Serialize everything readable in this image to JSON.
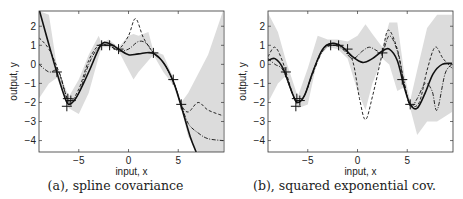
{
  "chart_data": [
    {
      "type": "line",
      "caption": "(a), spline covariance",
      "xlabel": "input, x",
      "ylabel": "output, y",
      "xlim": [
        -9,
        9.6
      ],
      "ylim": [
        -4.6,
        2.8
      ],
      "xticks": [
        "−5",
        "0",
        "5"
      ],
      "yticks": [
        "2",
        "1",
        "0",
        "−1",
        "−2",
        "−3",
        "−4"
      ],
      "training_points": {
        "x": [
          -7.2,
          -6.2,
          -6.1,
          -5.8,
          -2.7,
          -1.9,
          -1.0,
          2.5,
          4.5,
          5.3
        ],
        "y": [
          -0.4,
          -2.2,
          -1.8,
          -1.9,
          1.0,
          1.0,
          0.8,
          0.6,
          -0.8,
          -2.1
        ]
      },
      "series": [
        {
          "name": "mean",
          "style": "solid",
          "x": [
            -9,
            -7.5,
            -6.5,
            -6,
            -5.2,
            -4,
            -2.8,
            -2,
            -1,
            0,
            1,
            2.4,
            3.5,
            4.5,
            5.3,
            6.2,
            6.8
          ],
          "y": [
            2.9,
            0.1,
            -1.6,
            -2.1,
            -1.7,
            -0.4,
            1.0,
            1.1,
            0.8,
            0.5,
            0.55,
            0.6,
            0.1,
            -0.9,
            -2.2,
            -3.8,
            -4.6
          ]
        },
        {
          "name": "sample 1",
          "style": "dashed",
          "x": [
            -9,
            -8,
            -7,
            -6,
            -5,
            -4,
            -3,
            -2,
            -1,
            0,
            0.7,
            1.5,
            2.5,
            3.5,
            4.5,
            5.3,
            6,
            7,
            8,
            9.5
          ],
          "y": [
            1.4,
            0.8,
            -0.4,
            -1.9,
            -1.3,
            0.2,
            1.0,
            1.0,
            0.8,
            1.5,
            2.4,
            1.4,
            0.6,
            0.1,
            -0.9,
            -2.1,
            -2.5,
            -2.0,
            -2.4,
            -2.7
          ]
        },
        {
          "name": "sample 2",
          "style": "dash-dot",
          "x": [
            -9,
            -8,
            -7,
            -6,
            -5,
            -4,
            -3,
            -2,
            -1,
            0,
            1,
            1.8,
            2.5,
            3.5,
            4.5,
            5.3,
            6,
            7,
            8,
            9.5
          ],
          "y": [
            0.0,
            -0.4,
            -0.4,
            -2.0,
            -1.5,
            0.0,
            0.9,
            1.0,
            0.7,
            0.8,
            1.2,
            1.1,
            0.6,
            0.1,
            -0.9,
            -2.1,
            -3.1,
            -3.6,
            -3.9,
            -4.0
          ]
        }
      ],
      "confidence_band": {
        "x": [
          -9,
          -8,
          -7.2,
          -6,
          -5,
          -4,
          -3,
          -2.7,
          -2,
          -1,
          0,
          0.5,
          1,
          2,
          2.5,
          3.5,
          4.5,
          5.3,
          6,
          7,
          8,
          9.5
        ],
        "upper": [
          2.8,
          2.6,
          -0.1,
          -1.7,
          -0.8,
          0.5,
          1.5,
          1.1,
          1.3,
          0.9,
          1.5,
          1.6,
          1.5,
          1.7,
          0.7,
          0.5,
          -0.7,
          -2.0,
          -1.5,
          -0.5,
          0.5,
          2.8
        ],
        "lower": [
          -1.8,
          -1.0,
          -0.7,
          -2.3,
          -2.6,
          -1.5,
          0.4,
          0.9,
          0.9,
          0.7,
          -0.3,
          -0.8,
          -0.4,
          0.2,
          0.5,
          -0.4,
          -1.1,
          -2.3,
          -3.8,
          -4.6,
          -4.6,
          -4.6
        ]
      }
    },
    {
      "type": "line",
      "caption": "(b), squared exponential cov.",
      "xlabel": "input, x",
      "ylabel": "output, y",
      "xlim": [
        -9,
        9.6
      ],
      "ylim": [
        -4.6,
        2.8
      ],
      "xticks": [
        "−5",
        "0",
        "5"
      ],
      "yticks": [
        "2",
        "1",
        "0",
        "−1",
        "−2",
        "−3",
        "−4"
      ],
      "training_points": {
        "x": [
          -7.2,
          -6.2,
          -6.1,
          -5.8,
          -2.7,
          -1.9,
          -1.0,
          2.5,
          4.5,
          5.3
        ],
        "y": [
          -0.4,
          -2.2,
          -1.8,
          -1.9,
          1.0,
          1.0,
          0.8,
          0.6,
          -0.8,
          -2.1
        ]
      },
      "series": [
        {
          "name": "mean",
          "style": "solid",
          "x": [
            -9,
            -8.3,
            -7.5,
            -6.5,
            -6,
            -5.3,
            -4.5,
            -3.5,
            -2.5,
            -1.5,
            -0.5,
            0.5,
            1.5,
            2.5,
            3.2,
            4,
            4.7,
            5.3,
            6,
            6.8,
            7.6,
            8.5,
            9.5
          ],
          "y": [
            0.2,
            0.3,
            -0.2,
            -1.6,
            -2.0,
            -1.6,
            -0.4,
            0.8,
            1.1,
            0.9,
            0.4,
            0.1,
            0.3,
            0.7,
            0.8,
            0.2,
            -1.2,
            -2.1,
            -2.3,
            -1.5,
            -0.5,
            0.0,
            0.05
          ]
        },
        {
          "name": "sample 1",
          "style": "dashed",
          "x": [
            -9,
            -8.3,
            -7.5,
            -6.5,
            -6,
            -5.3,
            -4.5,
            -3.5,
            -2.5,
            -1.5,
            -0.5,
            0.2,
            0.8,
            1.5,
            2.5,
            3.1,
            4,
            4.7,
            5.3,
            6.2,
            7,
            7.8,
            8.6,
            9.5
          ],
          "y": [
            0.4,
            0.9,
            0.1,
            -1.6,
            -2.0,
            -1.6,
            -0.4,
            0.8,
            1.1,
            0.9,
            0.2,
            -1.8,
            -2.9,
            -1.7,
            0.6,
            1.8,
            0.8,
            -1.0,
            -2.1,
            -2.0,
            -0.3,
            0.9,
            0.3,
            -0.2
          ]
        },
        {
          "name": "sample 2",
          "style": "dash-dot",
          "x": [
            -9,
            -8.3,
            -7.5,
            -6.5,
            -6,
            -5.3,
            -4.5,
            -3.5,
            -2.5,
            -1.5,
            -0.5,
            0.5,
            1.2,
            2,
            2.5,
            3.2,
            4,
            4.7,
            5.3,
            6,
            6.8,
            7.5,
            8,
            8.8,
            9.5
          ],
          "y": [
            0.3,
            0.0,
            -0.3,
            -1.6,
            -2.0,
            -1.6,
            -0.5,
            0.7,
            1.0,
            0.8,
            0.3,
            0.7,
            0.9,
            0.7,
            0.6,
            1.5,
            0.7,
            -1.0,
            -2.2,
            -1.8,
            -1.0,
            -1.4,
            -2.4,
            -0.5,
            0.0
          ]
        }
      ],
      "confidence_band": {
        "x": [
          -9,
          -8,
          -7.2,
          -6,
          -5,
          -4,
          -3,
          -2,
          -1,
          0,
          0.8,
          1.5,
          2.5,
          3.2,
          4,
          4.7,
          5.3,
          6,
          7,
          8,
          9.5
        ],
        "upper": [
          2.7,
          1.7,
          0.2,
          -1.7,
          -0.2,
          1.5,
          1.3,
          1.3,
          1.2,
          1.5,
          2.1,
          1.6,
          0.9,
          2.2,
          2.2,
          -0.5,
          -1.9,
          -0.3,
          1.9,
          2.6,
          2.6
        ],
        "lower": [
          -2.0,
          -1.0,
          -0.6,
          -2.3,
          -2.1,
          0.3,
          0.9,
          0.8,
          0.3,
          -1.4,
          -2.4,
          -1.0,
          0.3,
          0.0,
          -1.4,
          -1.2,
          -2.3,
          -3.7,
          -3.0,
          -3.0,
          -2.5
        ]
      }
    }
  ]
}
